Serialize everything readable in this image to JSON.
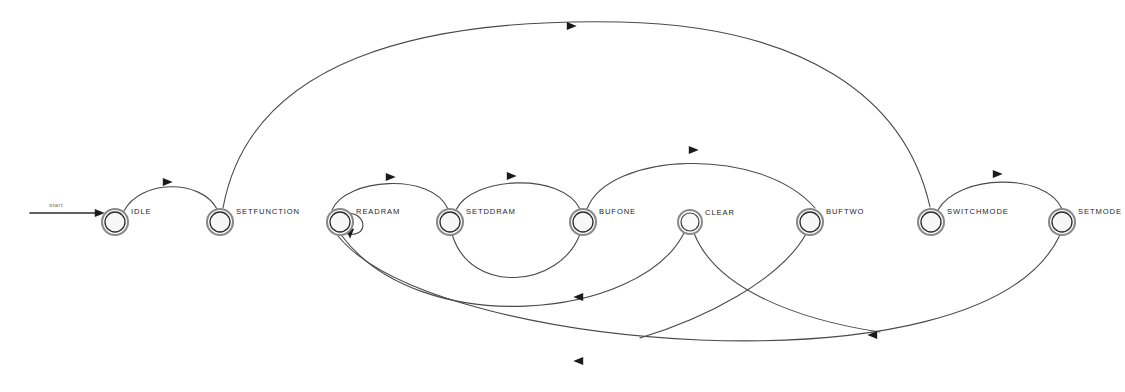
{
  "diagram": {
    "type": "finite-state-machine",
    "background_color": "#ffffff",
    "node_stroke_color": "#8a8a8a",
    "edge_stroke_color": "#4a4a4a",
    "arrow_color": "#1a1a1a",
    "label_color": "#262626",
    "canvas": {
      "width": 1125,
      "height": 392
    }
  },
  "start_marker": {
    "label": "start",
    "x": 30,
    "y": 212,
    "target": "IDLE"
  },
  "states": [
    {
      "id": "idle",
      "label": "IDLE",
      "cx": 115,
      "cy": 222,
      "r_outer": 13,
      "r_inner": 10,
      "shape": "double-circle"
    },
    {
      "id": "setfunction",
      "label": "SETFUNCTION",
      "cx": 220,
      "cy": 222,
      "r_outer": 13,
      "r_inner": 10,
      "shape": "double-circle"
    },
    {
      "id": "readram",
      "label": "READRAM",
      "cx": 340,
      "cy": 222,
      "r_outer": 13,
      "r_inner": 10,
      "shape": "double-circle"
    },
    {
      "id": "setddram",
      "label": "SETDDRAM",
      "cx": 450,
      "cy": 222,
      "r_outer": 13,
      "r_inner": 10,
      "shape": "double-circle"
    },
    {
      "id": "bufone",
      "label": "BUFONE",
      "cx": 583,
      "cy": 222,
      "r_outer": 13,
      "r_inner": 10,
      "shape": "double-circle"
    },
    {
      "id": "clear",
      "label": "CLEAR",
      "cx": 690,
      "cy": 222,
      "r_outer": 12,
      "r_inner": 9,
      "shape": "single-circle"
    },
    {
      "id": "buftwo",
      "label": "BUFTWO",
      "cx": 810,
      "cy": 222,
      "r_outer": 13,
      "r_inner": 10,
      "shape": "double-circle"
    },
    {
      "id": "switchmode",
      "label": "SWITCHMODE",
      "cx": 931,
      "cy": 222,
      "r_outer": 13,
      "r_inner": 10,
      "shape": "double-circle"
    },
    {
      "id": "setmode",
      "label": "SETMODE",
      "cx": 1062,
      "cy": 222,
      "r_outer": 13,
      "r_inner": 10,
      "shape": "double-circle"
    }
  ],
  "transitions": [
    {
      "id": "t-start-idle",
      "from": "start",
      "to": "idle",
      "label": "",
      "path": "M 30 213 L 98 213",
      "arrow": {
        "x": 100,
        "y": 213,
        "dir": "right"
      }
    },
    {
      "id": "t-idle-setfunction",
      "from": "idle",
      "to": "setfunction",
      "label": "",
      "path": "M 124 211 C 140 180, 200 178, 217 209",
      "arrow": {
        "x": 168,
        "y": 182,
        "dir": "right"
      }
    },
    {
      "id": "t-setfunction-switchmode",
      "from": "setfunction",
      "to": "switchmode",
      "label": "",
      "path": "M 223 208 C 250 60, 420 18, 620 22 C 800 26, 905 95, 930 207",
      "arrow": {
        "x": 572,
        "y": 26,
        "dir": "right"
      }
    },
    {
      "id": "t-readram-readram",
      "from": "readram",
      "to": "readram",
      "label": "",
      "path": "M 348 213 C 368 214, 368 238, 347 234",
      "arrow": {
        "x": 350,
        "y": 234,
        "dir": "down"
      }
    },
    {
      "id": "t-readram-setddram",
      "from": "readram",
      "to": "setddram",
      "label": "",
      "path": "M 332 210 C 345 178, 432 172, 448 209",
      "arrow": {
        "x": 391,
        "y": 177,
        "dir": "right"
      }
    },
    {
      "id": "t-setddram-bufone",
      "from": "setddram",
      "to": "bufone",
      "label": "",
      "path": "M 456 210 C 472 176, 562 172, 580 209",
      "arrow": {
        "x": 512,
        "y": 176,
        "dir": "right"
      }
    },
    {
      "id": "t-bufone-buftwo",
      "from": "bufone",
      "to": "buftwo",
      "label": "",
      "path": "M 587 209 C 608 152, 760 145, 815 208",
      "arrow": {
        "x": 694,
        "y": 150,
        "dir": "right"
      }
    },
    {
      "id": "t-switchmode-setmode",
      "from": "switchmode",
      "to": "setmode",
      "label": "",
      "path": "M 938 210 C 958 174, 1046 172, 1062 209",
      "arrow": {
        "x": 998,
        "y": 174,
        "dir": "right"
      }
    },
    {
      "id": "t-bufone-setddram",
      "from": "bufone",
      "to": "setddram",
      "label": "",
      "path": "M 580 234 C 560 288, 470 296, 452 234",
      "arrow": {
        "x": 578,
        "y": 297,
        "dir": "left"
      }
    },
    {
      "id": "t-clear-readram",
      "from": "clear",
      "to": "readram",
      "label": "",
      "path": "M 684 233 C 640 320, 420 340, 342 236",
      "arrow": {
        "x": 578,
        "y": 361,
        "dir": "left"
      }
    },
    {
      "id": "t-setmode-readram",
      "from": "setmode",
      "to": "readram",
      "label": "",
      "path": "M 1060 235 C 1020 320, 860 346, 700 340 C 560 334, 390 300, 338 236",
      "arrow": {
        "x": 872,
        "y": 335,
        "dir": "left"
      }
    },
    {
      "id": "t-clear-buftwo-down",
      "from": "clear",
      "to": "buftwo",
      "label": "",
      "path": "M 694 233 C 716 290, 800 320, 880 332"
    },
    {
      "id": "t-buftwo-down",
      "from": "buftwo",
      "to": "clear",
      "label": "",
      "path": "M 806 234 C 780 280, 706 318, 640 338"
    }
  ]
}
